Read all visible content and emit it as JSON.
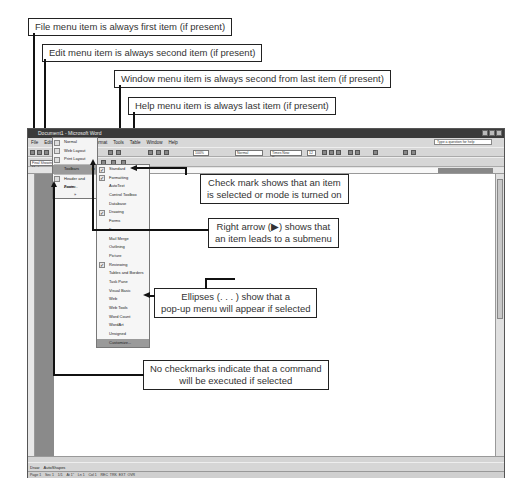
{
  "callouts": {
    "file": "File menu item is always first item (if present)",
    "edit": "Edit menu item is always second item (if present)",
    "window": "Window menu item is always second from last item (if present)",
    "help": "Help menu item is always last item (if present)",
    "check_line1": "Check mark shows that an item",
    "check_line2": "is selected or mode is turned on",
    "arrow_line1": "Right arrow (▶) shows that",
    "arrow_line2": "an item leads to a submenu",
    "ellipses_line1": "Ellipses (. . . ) show that a",
    "ellipses_line2": "pop-up menu will appear if selected",
    "nocheck_line1": "No checkmarks indicate that a command",
    "nocheck_line2": "will be executed if selected"
  },
  "window": {
    "title": "Document1 - Microsoft Word",
    "help_placeholder": "Type a question for help",
    "menus": [
      "File",
      "Edit",
      "View",
      "Insert",
      "Format",
      "Tools",
      "Table",
      "Window",
      "Help"
    ],
    "zoom": "100%",
    "style": "Normal",
    "font": "Times New Roman",
    "size": "12",
    "style_box": "Final Showing Markup",
    "draw_label": "Draw",
    "autoshapes_label": "AutoShapes",
    "status": [
      "Page 1",
      "Sec 1",
      "1/1",
      "At 1\"",
      "Ln 1",
      "Col 1",
      "REC",
      "TRK",
      "EXT",
      "OVR"
    ]
  },
  "view_menu": {
    "items": [
      {
        "label": "Normal",
        "icon": "normal-view-icon"
      },
      {
        "label": "Web Layout",
        "icon": "web-layout-icon"
      },
      {
        "label": "Print Layout",
        "icon": "print-layout-icon"
      },
      {
        "label": "Toolbars",
        "submenu": true,
        "highlighted": true
      },
      {
        "label": "Header and Footer",
        "icon": "header-footer-icon"
      },
      {
        "label": "Zoom..."
      }
    ],
    "expand": "»"
  },
  "toolbars_submenu": {
    "items": [
      {
        "label": "Standard",
        "checked": true
      },
      {
        "label": "Formatting",
        "checked": true
      },
      {
        "label": "AutoText",
        "checked": false
      },
      {
        "label": "Control Toolbox",
        "checked": false
      },
      {
        "label": "Database",
        "checked": false
      },
      {
        "label": "Drawing",
        "checked": true
      },
      {
        "label": "Forms",
        "checked": false
      },
      {
        "label": "Frames",
        "checked": false
      },
      {
        "label": "Mail Merge",
        "checked": false
      },
      {
        "label": "Outlining",
        "checked": false
      },
      {
        "label": "Picture",
        "checked": false
      },
      {
        "label": "Reviewing",
        "checked": true
      },
      {
        "label": "Tables and Borders",
        "checked": false
      },
      {
        "label": "Task Pane",
        "checked": false
      },
      {
        "label": "Visual Basic",
        "checked": false
      },
      {
        "label": "Web",
        "checked": false
      },
      {
        "label": "Web Tools",
        "checked": false
      },
      {
        "label": "Word Count",
        "checked": false
      },
      {
        "label": "WordArt",
        "checked": false
      },
      {
        "label": "Unsigned",
        "checked": false
      },
      {
        "label": "Customize...",
        "checked": false,
        "highlighted": true
      }
    ],
    "checkmark": "✓"
  }
}
